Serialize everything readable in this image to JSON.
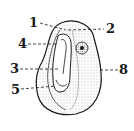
{
  "diagram": {
    "labels": [
      {
        "id": "1",
        "text": "1",
        "x": 29,
        "y": 16
      },
      {
        "id": "2",
        "text": "2",
        "x": 106,
        "y": 22
      },
      {
        "id": "4",
        "text": "4",
        "x": 18,
        "y": 37
      },
      {
        "id": "3",
        "text": "3",
        "x": 10,
        "y": 62
      },
      {
        "id": "5",
        "text": "5",
        "x": 11,
        "y": 83
      },
      {
        "id": "8",
        "text": "8",
        "x": 119,
        "y": 63
      }
    ],
    "colors": {
      "stroke": "#1a1a1a",
      "fill": "#ffffff",
      "stipple": "#6b6b6b"
    }
  }
}
